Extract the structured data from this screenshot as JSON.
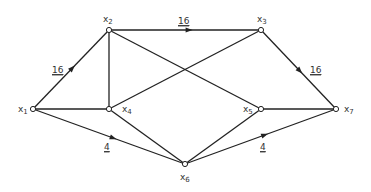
{
  "diagram": {
    "type": "directed-network-graph",
    "colors": {
      "line": "#222222",
      "text": "#333333",
      "background": "#ffffff"
    },
    "nodes": [
      {
        "id": "x1",
        "label": "x",
        "sub": "1",
        "x": 33,
        "y": 109,
        "lx": 18,
        "ly": 112
      },
      {
        "id": "x2",
        "label": "x",
        "sub": "2",
        "x": 109,
        "y": 30,
        "lx": 103,
        "ly": 22
      },
      {
        "id": "x3",
        "label": "x",
        "sub": "3",
        "x": 261,
        "y": 30,
        "lx": 257,
        "ly": 22
      },
      {
        "id": "x4",
        "label": "x",
        "sub": "4",
        "x": 109,
        "y": 109,
        "lx": 122,
        "ly": 112
      },
      {
        "id": "x5",
        "label": "x",
        "sub": "5",
        "x": 261,
        "y": 109,
        "lx": 243,
        "ly": 112
      },
      {
        "id": "x6",
        "label": "x",
        "sub": "6",
        "x": 185,
        "y": 164,
        "lx": 180,
        "ly": 180
      },
      {
        "id": "x7",
        "label": "x",
        "sub": "7",
        "x": 336,
        "y": 109,
        "lx": 344,
        "ly": 112
      }
    ],
    "edges": [
      {
        "from": "x1",
        "to": "x2",
        "weight": "16",
        "arrow": true,
        "wx": 52,
        "wy": 73
      },
      {
        "from": "x1",
        "to": "x4",
        "weight": "",
        "arrow": false
      },
      {
        "from": "x1",
        "to": "x6",
        "weight": "4",
        "arrow": true,
        "wx": 104,
        "wy": 150
      },
      {
        "from": "x2",
        "to": "x3",
        "weight": "16",
        "arrow": true,
        "wx": 178,
        "wy": 24
      },
      {
        "from": "x2",
        "to": "x4",
        "weight": "",
        "arrow": false
      },
      {
        "from": "x2",
        "to": "x5",
        "weight": "",
        "arrow": false
      },
      {
        "from": "x4",
        "to": "x3",
        "weight": "",
        "arrow": false
      },
      {
        "from": "x4",
        "to": "x6",
        "weight": "",
        "arrow": false
      },
      {
        "from": "x3",
        "to": "x7",
        "weight": "16",
        "arrow": true,
        "wx": 310,
        "wy": 73
      },
      {
        "from": "x5",
        "to": "x7",
        "weight": "",
        "arrow": false
      },
      {
        "from": "x5",
        "to": "x6",
        "weight": "",
        "arrow": false
      },
      {
        "from": "x6",
        "to": "x7",
        "weight": "4",
        "arrow": true,
        "wx": 260,
        "wy": 150
      }
    ]
  }
}
